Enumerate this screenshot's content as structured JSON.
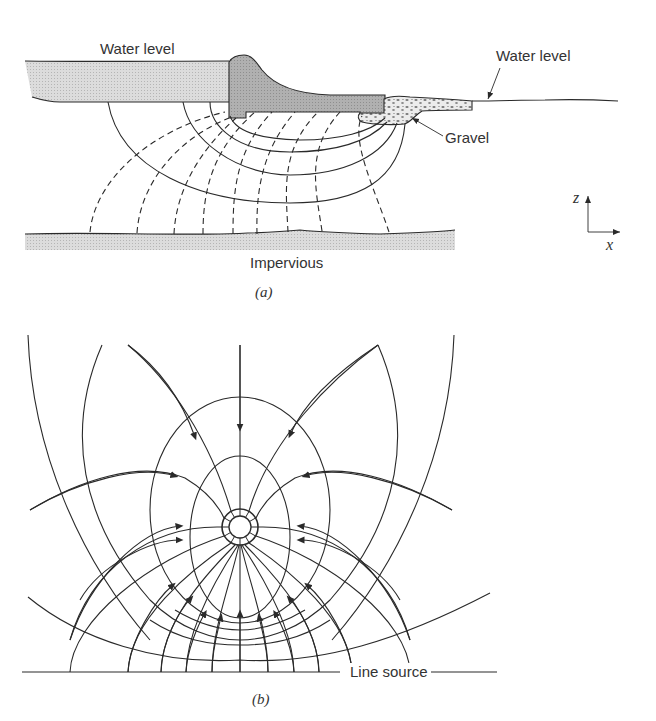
{
  "figure_a": {
    "caption": "(a)",
    "labels": {
      "water_level_left": "Water level",
      "water_level_right": "Water level",
      "gravel": "Gravel",
      "impervious": "Impervious"
    },
    "axes": {
      "z": "z",
      "x": "x"
    },
    "description": "Seepage flow net beneath a dam: solid flow lines and dashed equipotential lines between upstream water and impervious layer"
  },
  "figure_b": {
    "caption": "(b)",
    "labels": {
      "line_source": "Line source"
    },
    "description": "Flow net with arrows converging toward a circular well/sink, above a line source"
  },
  "colors": {
    "line": "#2a2a2a",
    "water_fill": "#d9d9d9",
    "dam_fill": "#a9a9a9",
    "impervious_fill": "#cfcfcf",
    "gravel_fill": "#e6e6e6"
  }
}
